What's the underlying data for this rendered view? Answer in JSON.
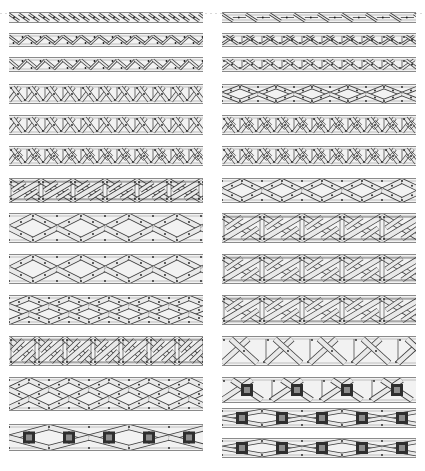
{
  "page": {
    "title": "",
    "description_visible_text": "",
    "background": "#ffffff"
  },
  "colors": {
    "strand_fill": "#e9e9e9",
    "strand_stroke": "#3a3a3a",
    "band_background": "#f2f2f2",
    "band_edge": "#8a8a8a",
    "dot": "#1a1a1a",
    "square_outer": "#2e2e2e",
    "square_inner": "#8c8c8c"
  },
  "columns": [
    {
      "name": "left",
      "x": 9,
      "width": 194,
      "bands": [
        {
          "id": "L1",
          "y": 12,
          "h": 11,
          "pattern": "twist-single",
          "cell": 10,
          "squares": false
        },
        {
          "id": "L2",
          "y": 33,
          "h": 14,
          "pattern": "twist-offset",
          "cell": 18,
          "squares": false
        },
        {
          "id": "L3",
          "y": 57,
          "h": 15,
          "pattern": "twist-offset",
          "cell": 18,
          "squares": false
        },
        {
          "id": "L4",
          "y": 84,
          "h": 20,
          "pattern": "knot-key",
          "cell": 18,
          "squares": false
        },
        {
          "id": "L5",
          "y": 115,
          "h": 20,
          "pattern": "knot-key",
          "cell": 18,
          "squares": false
        },
        {
          "id": "L6",
          "y": 146,
          "h": 20,
          "pattern": "knot-loop",
          "cell": 18,
          "squares": false
        },
        {
          "id": "L7",
          "y": 178,
          "h": 25,
          "pattern": "knot-square",
          "cell": 32,
          "squares": false
        },
        {
          "id": "L8",
          "y": 213,
          "h": 30,
          "pattern": "plait-3",
          "cell": 24,
          "squares": false
        },
        {
          "id": "L9",
          "y": 254,
          "h": 30,
          "pattern": "plait-3",
          "cell": 24,
          "squares": false
        },
        {
          "id": "L10",
          "y": 295,
          "h": 30,
          "pattern": "plait-4",
          "cell": 20,
          "squares": false
        },
        {
          "id": "L11",
          "y": 336,
          "h": 30,
          "pattern": "knot-square",
          "cell": 28,
          "squares": false
        },
        {
          "id": "L12",
          "y": 377,
          "h": 34,
          "pattern": "plait-4",
          "cell": 20,
          "squares": false
        },
        {
          "id": "L13",
          "y": 424,
          "h": 27,
          "pattern": "plait-3",
          "cell": 40,
          "squares": true
        }
      ]
    },
    {
      "name": "right",
      "x": 222,
      "width": 194,
      "bands": [
        {
          "id": "R1",
          "y": 12,
          "h": 11,
          "pattern": "twist-gap",
          "cell": 24,
          "squares": false
        },
        {
          "id": "R2",
          "y": 33,
          "h": 14,
          "pattern": "knot-key",
          "cell": 20,
          "squares": false
        },
        {
          "id": "R3",
          "y": 57,
          "h": 15,
          "pattern": "knot-key",
          "cell": 20,
          "squares": false
        },
        {
          "id": "R4",
          "y": 84,
          "h": 20,
          "pattern": "plait-3",
          "cell": 18,
          "squares": false
        },
        {
          "id": "R5",
          "y": 115,
          "h": 20,
          "pattern": "knot-loop",
          "cell": 18,
          "squares": false
        },
        {
          "id": "R6",
          "y": 146,
          "h": 20,
          "pattern": "knot-loop",
          "cell": 18,
          "squares": false
        },
        {
          "id": "R7",
          "y": 178,
          "h": 25,
          "pattern": "plait-3",
          "cell": 20,
          "squares": false
        },
        {
          "id": "R8",
          "y": 213,
          "h": 30,
          "pattern": "knot-square",
          "cell": 40,
          "squares": false
        },
        {
          "id": "R9",
          "y": 254,
          "h": 30,
          "pattern": "knot-square",
          "cell": 40,
          "squares": false
        },
        {
          "id": "R10",
          "y": 295,
          "h": 30,
          "pattern": "knot-square",
          "cell": 40,
          "squares": false
        },
        {
          "id": "R11",
          "y": 336,
          "h": 30,
          "pattern": "knot-key",
          "cell": 44,
          "squares": false
        },
        {
          "id": "R12",
          "y": 377,
          "h": 26,
          "pattern": "knot-key",
          "cell": 50,
          "squares": true
        },
        {
          "id": "R13",
          "y": 408,
          "h": 20,
          "pattern": "plait-3",
          "cell": 40,
          "squares": true
        },
        {
          "id": "R14",
          "y": 438,
          "h": 20,
          "pattern": "plait-3",
          "cell": 40,
          "squares": true
        }
      ]
    }
  ]
}
